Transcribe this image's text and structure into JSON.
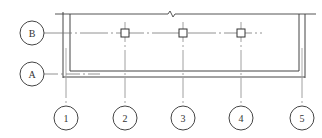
{
  "diagram": {
    "type": "structural-plan-grid",
    "row_axes": [
      {
        "label": "B",
        "cx": 32,
        "cy": 33
      },
      {
        "label": "A",
        "cx": 32,
        "cy": 74
      }
    ],
    "column_axes": [
      {
        "label": "1",
        "cx": 66,
        "cy": 118
      },
      {
        "label": "2",
        "cx": 125,
        "cy": 118
      },
      {
        "label": "3",
        "cx": 183,
        "cy": 118
      },
      {
        "label": "4",
        "cx": 241,
        "cy": 118
      },
      {
        "label": "5",
        "cx": 302,
        "cy": 118
      }
    ],
    "columns": [
      {
        "x": 125,
        "y": 33
      },
      {
        "x": 183,
        "y": 33
      },
      {
        "x": 241,
        "y": 33
      }
    ],
    "colors": {
      "line": "#444444",
      "grid": "#777777",
      "background": "#ffffff"
    }
  }
}
